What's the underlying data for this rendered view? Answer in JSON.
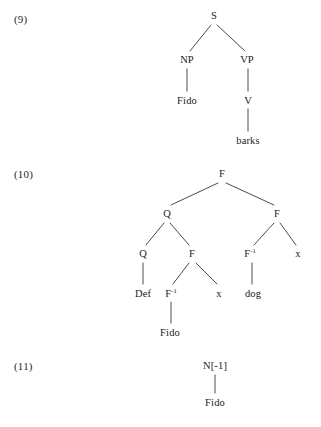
{
  "page": {
    "background_color": "#ffffff",
    "text_color": "#23201f",
    "line_color": "#3a3635"
  },
  "examples": [
    {
      "label": "(9)"
    },
    {
      "label": "(10)"
    },
    {
      "label": "(11)"
    }
  ],
  "trees": {
    "tree9": {
      "example_label": "(9)",
      "root": "S",
      "nodes": {
        "s": "S",
        "np": "NP",
        "vp": "VP",
        "fido": "Fido",
        "v": "V",
        "barks": "barks"
      }
    },
    "tree10": {
      "example_label": "(10)",
      "root": "F",
      "nodes": {
        "f_root": "F",
        "q_left": "Q",
        "f_right": "F",
        "q_left_left": "Q",
        "f_left_right": "F",
        "finv_right": "F",
        "finv_right_sup": "-1",
        "x_right": "x",
        "def": "Def",
        "finv_left": "F",
        "finv_left_sup": "-1",
        "x_mid": "x",
        "dog": "dog",
        "fido": "Fido"
      }
    },
    "tree11": {
      "example_label": "(11)",
      "root": "N[-1]",
      "nodes": {
        "n_minus1": "N[-1]",
        "fido": "Fido"
      }
    }
  }
}
